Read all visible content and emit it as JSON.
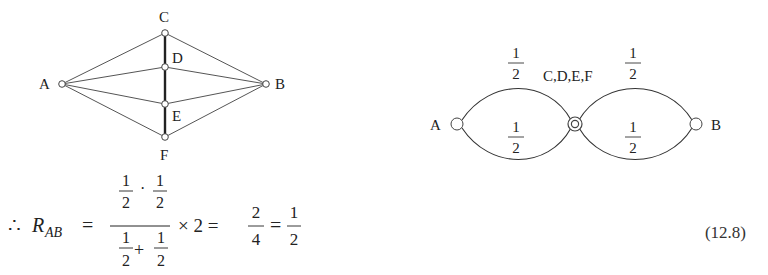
{
  "left_diagram": {
    "nodes": {
      "A": {
        "label": "A",
        "x": 62,
        "y": 84
      },
      "B": {
        "label": "B",
        "x": 266,
        "y": 84
      },
      "C": {
        "label": "C",
        "x": 165,
        "y": 33
      },
      "D": {
        "label": "D",
        "x": 165,
        "y": 67
      },
      "E": {
        "label": "E",
        "x": 165,
        "y": 104
      },
      "F": {
        "label": "F",
        "x": 165,
        "y": 137
      }
    },
    "edges": [
      [
        "A",
        "C"
      ],
      [
        "A",
        "D"
      ],
      [
        "A",
        "E"
      ],
      [
        "A",
        "F"
      ],
      [
        "B",
        "C"
      ],
      [
        "B",
        "D"
      ],
      [
        "B",
        "E"
      ],
      [
        "B",
        "F"
      ],
      [
        "C",
        "F"
      ]
    ]
  },
  "right_diagram": {
    "node_a": "A",
    "node_b": "B",
    "merged_node": "C,D,E,F",
    "resistors": [
      {
        "position": "A-top",
        "num": "1",
        "den": "2"
      },
      {
        "position": "A-bottom",
        "num": "1",
        "den": "2"
      },
      {
        "position": "B-top",
        "num": "1",
        "den": "2"
      },
      {
        "position": "B-bottom",
        "num": "1",
        "den": "2"
      }
    ]
  },
  "equation": {
    "therefore": "∴",
    "lhs": "R",
    "lhs_sub": "AB",
    "equals": "=",
    "num_a_num": "1",
    "num_a_den": "2",
    "dot": "·",
    "num_b_num": "1",
    "num_b_den": "2",
    "den_a_num": "1",
    "den_a_den": "2",
    "plus": "+",
    "den_b_num": "1",
    "den_b_den": "2",
    "times": "× 2 =",
    "r1_num": "2",
    "r1_den": "4",
    "equals2": "=",
    "r2_num": "1",
    "r2_den": "2",
    "number": "(12.8)"
  }
}
